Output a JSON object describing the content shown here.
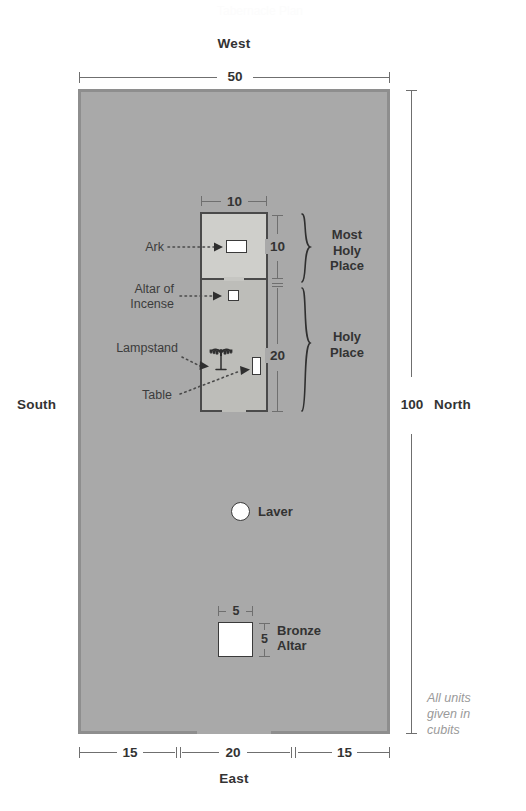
{
  "title_ghost": "Tabernacle Plan",
  "compass": {
    "west": "West",
    "east": "East",
    "north": "North",
    "south": "South"
  },
  "dimensions": {
    "court_width": "50",
    "court_length": "100",
    "building_width": "10",
    "most_holy_length": "10",
    "holy_length": "20",
    "entrance_left": "15",
    "entrance_middle": "20",
    "entrance_right": "15",
    "bronze_altar_width": "5",
    "bronze_altar_depth": "5"
  },
  "rooms": {
    "most_holy_place": "Most\nHoly\nPlace",
    "most_holy_place_lines": [
      "Most",
      "Holy",
      "Place"
    ],
    "holy_place_lines": [
      "Holy",
      "Place"
    ]
  },
  "furniture": {
    "ark": "Ark",
    "altar_of_incense_lines": [
      "Altar of",
      "Incense"
    ],
    "lampstand": "Lampstand",
    "table": "Table",
    "laver": "Laver",
    "bronze_altar_lines": [
      "Bronze",
      "Altar"
    ]
  },
  "footnote_lines": [
    "All units",
    "given in",
    "cubits"
  ],
  "colors": {
    "courtyard_fill": "#a9a9a9",
    "courtyard_border": "#8e8e8e",
    "most_holy_fill": "#cfcfcb",
    "holy_fill": "#bdbdb9",
    "object_fill": "#ffffff",
    "object_stroke": "#3a3a3a",
    "text": "#333333",
    "footnote_text": "#9a9a9a",
    "rule": "#6f6f6f"
  },
  "icons": {
    "lampstand": "menorah-icon",
    "laver": "circle-basin-icon",
    "pointer": "triangle-pointer-icon"
  }
}
